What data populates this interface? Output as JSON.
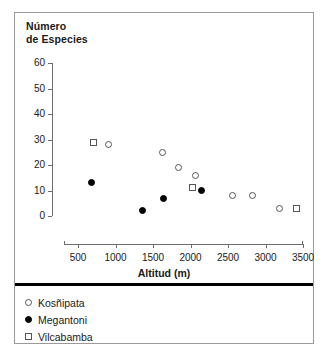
{
  "chart_data": {
    "type": "scatter",
    "title": "",
    "ylabel": "Número\nde Especies",
    "xlabel": "Altitud (m)",
    "xlim": [
      300,
      3620
    ],
    "ylim": [
      0,
      60
    ],
    "xticks": [
      500,
      1000,
      1500,
      2000,
      2500,
      3000,
      3500
    ],
    "yticks": [
      0,
      10,
      20,
      30,
      40,
      50,
      60
    ],
    "grid": false,
    "legend_position": "below-plot",
    "series": [
      {
        "name": "Kosñipata",
        "marker": "open-circle",
        "color": "#555555",
        "points": [
          {
            "x": 900,
            "y": 28
          },
          {
            "x": 1620,
            "y": 25
          },
          {
            "x": 1840,
            "y": 19
          },
          {
            "x": 2060,
            "y": 16
          },
          {
            "x": 2560,
            "y": 8
          },
          {
            "x": 2820,
            "y": 8
          },
          {
            "x": 3190,
            "y": 3
          }
        ]
      },
      {
        "name": "Megantoni",
        "marker": "filled-circle",
        "color": "#000000",
        "points": [
          {
            "x": 680,
            "y": 13
          },
          {
            "x": 1360,
            "y": 2
          },
          {
            "x": 1640,
            "y": 7
          },
          {
            "x": 2150,
            "y": 10
          }
        ]
      },
      {
        "name": "Vilcabamba",
        "marker": "open-square",
        "color": "#555555",
        "points": [
          {
            "x": 700,
            "y": 29
          },
          {
            "x": 2030,
            "y": 11
          },
          {
            "x": 3410,
            "y": 3
          }
        ]
      }
    ]
  },
  "legend": {
    "items": [
      {
        "label": "Kosñipata",
        "marker": "open-circle"
      },
      {
        "label": "Megantoni",
        "marker": "filled-circle"
      },
      {
        "label": "Vilcabamba",
        "marker": "open-square"
      }
    ]
  }
}
